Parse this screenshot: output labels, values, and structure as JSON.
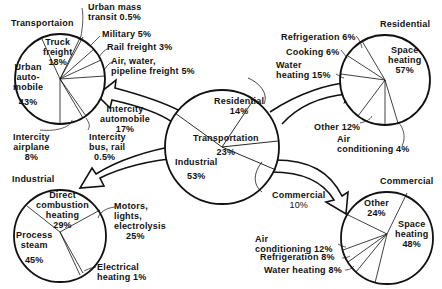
{
  "center": {
    "title": "Total energy",
    "slices": [
      {
        "label": "Transportation",
        "value": "23%"
      },
      {
        "label": "Industrial",
        "value": "53%"
      },
      {
        "label": "Residential",
        "value": "14%"
      },
      {
        "label": "Commercial",
        "value": "10%"
      }
    ]
  },
  "transportation": {
    "title": "Transportaion",
    "slices": [
      {
        "label": "Urban auto-mobile",
        "line1": "Urban",
        "line2": "auto-",
        "line3": "mobile",
        "value": "43%"
      },
      {
        "label": "Truck freight",
        "line1": "Truck",
        "line2": "freight",
        "value": "18%"
      },
      {
        "label": "Urban mass transit",
        "line1": "Urban mass",
        "line2": "transit 0.5%",
        "value": "0.5%"
      },
      {
        "label": "Military",
        "text": "Military 5%",
        "value": "5%"
      },
      {
        "label": "Rail freight",
        "text": "Rail freight 3%",
        "value": "3%"
      },
      {
        "label": "Air, water, pipeline freight",
        "line1": "Air, water,",
        "line2": "pipeline freight 5%",
        "value": "5%"
      },
      {
        "label": "Intercity automobile",
        "line1": "Intercity",
        "line2": "automobile",
        "value": "17%"
      },
      {
        "label": "Intercity bus, rail",
        "line1": "Intercity",
        "line2": "bus, rail",
        "value": "0.5%"
      },
      {
        "label": "Intercity airplane",
        "line1": "Intercity",
        "line2": "airplane",
        "value": "8%"
      }
    ]
  },
  "residential": {
    "title": "Residential",
    "slices": [
      {
        "label": "Space heating",
        "line1": "Space",
        "line2": "heating",
        "value": "57%"
      },
      {
        "label": "Refrigeration",
        "text": "Refrigeration 6%",
        "value": "6%"
      },
      {
        "label": "Cooking",
        "text": "Cooking 6%",
        "value": "6%"
      },
      {
        "label": "Water heating",
        "line1": "Water",
        "line2": "heating 15%",
        "value": "15%"
      },
      {
        "label": "Other",
        "text": "Other 12%",
        "value": "12%"
      },
      {
        "label": "Air conditioning",
        "line1": "Air",
        "line2": "conditioning 4%",
        "value": "4%"
      }
    ]
  },
  "industrial": {
    "title": "Industrial",
    "slices": [
      {
        "label": "Direct combustion heating",
        "line1": "Direct",
        "line2": "combustion",
        "line3": "heating",
        "value": "29%"
      },
      {
        "label": "Process steam",
        "line1": "Process",
        "line2": "steam",
        "value": "45%"
      },
      {
        "label": "Motors, lights, electrolysis",
        "line1": "Motors,",
        "line2": "lights,",
        "line3": "electrolysis",
        "value": "25%"
      },
      {
        "label": "Electrical heating",
        "line1": "Electrical",
        "line2": "heating 1%",
        "value": "1%"
      }
    ]
  },
  "commercial": {
    "title": "Commercial",
    "slices": [
      {
        "label": "Other",
        "line1": "Other",
        "value": "24%"
      },
      {
        "label": "Space heating",
        "line1": "Space",
        "line2": "heating",
        "value": "48%"
      },
      {
        "label": "Air conditioning",
        "line1": "Air",
        "line2": "conditioning 12%",
        "value": "12%"
      },
      {
        "label": "Refrigeration",
        "text": "Refrigeration 8%",
        "value": "8%"
      },
      {
        "label": "Water heating",
        "text": "Water heating 8%",
        "value": "8%"
      }
    ]
  },
  "colors": {
    "ink": "#111111",
    "background": "#ffffff"
  }
}
